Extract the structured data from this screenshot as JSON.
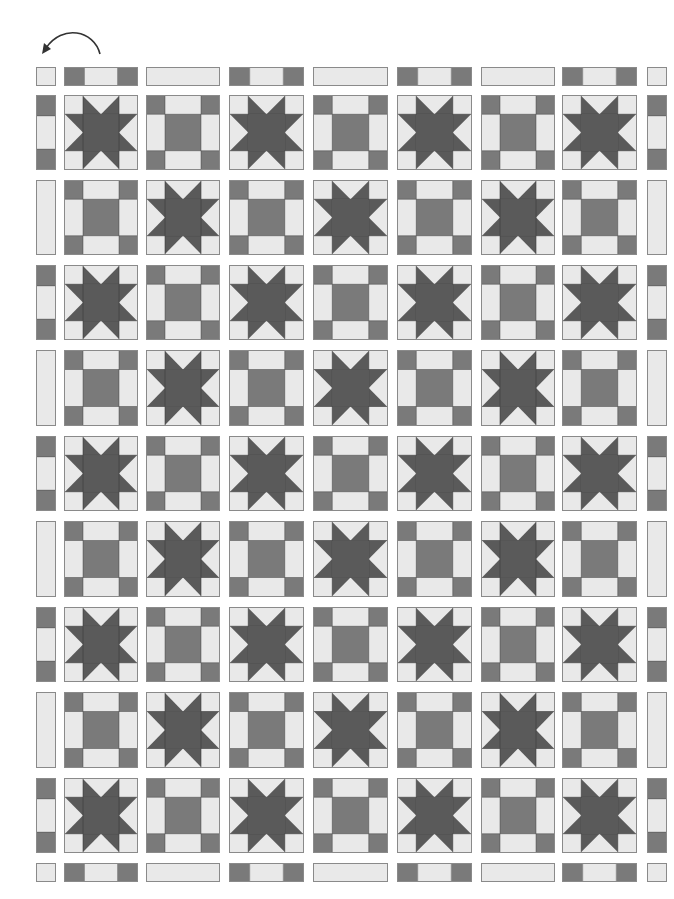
{
  "diagram": {
    "type": "quilt-layout",
    "arrow": {
      "icon": "rotate-counterclockwise-arrow",
      "direction": "counterclockwise"
    },
    "grid": {
      "block_columns": 7,
      "block_rows": 9
    },
    "colors": {
      "light": "#e9e9e9",
      "medium": "#7a7a7a",
      "dark": "#5a5a5a",
      "outline": "#8a8a8a",
      "seam": "#3a3a3a"
    },
    "columns_x": [
      {
        "x": 64,
        "w": 74
      },
      {
        "x": 146,
        "w": 74
      },
      {
        "x": 229,
        "w": 75
      },
      {
        "x": 313,
        "w": 75
      },
      {
        "x": 397,
        "w": 75
      },
      {
        "x": 481,
        "w": 74
      },
      {
        "x": 562,
        "w": 75
      }
    ],
    "side_strip_left": {
      "x": 36,
      "w": 20
    },
    "side_strip_right": {
      "x": 647,
      "w": 20
    },
    "rows_y": [
      {
        "y": 95,
        "h": 75
      },
      {
        "y": 180,
        "h": 75
      },
      {
        "y": 265,
        "h": 75
      },
      {
        "y": 350,
        "h": 76
      },
      {
        "y": 436,
        "h": 75
      },
      {
        "y": 521,
        "h": 76
      },
      {
        "y": 607,
        "h": 75
      },
      {
        "y": 692,
        "h": 76
      },
      {
        "y": 778,
        "h": 75
      }
    ],
    "sash_top": {
      "y": 67,
      "h": 19
    },
    "sash_bottom": {
      "y": 863,
      "h": 19
    },
    "block_pattern": [
      [
        "star",
        "nine-patch",
        "star",
        "nine-patch",
        "star",
        "nine-patch",
        "star"
      ],
      [
        "nine-patch",
        "star",
        "nine-patch",
        "star",
        "nine-patch",
        "star",
        "nine-patch"
      ],
      [
        "star",
        "nine-patch",
        "star",
        "nine-patch",
        "star",
        "nine-patch",
        "star"
      ],
      [
        "nine-patch",
        "star",
        "nine-patch",
        "star",
        "nine-patch",
        "star",
        "nine-patch"
      ],
      [
        "star",
        "nine-patch",
        "star",
        "nine-patch",
        "star",
        "nine-patch",
        "star"
      ],
      [
        "nine-patch",
        "star",
        "nine-patch",
        "star",
        "nine-patch",
        "star",
        "nine-patch"
      ],
      [
        "star",
        "nine-patch",
        "star",
        "nine-patch",
        "star",
        "nine-patch",
        "star"
      ],
      [
        "nine-patch",
        "star",
        "nine-patch",
        "star",
        "nine-patch",
        "star",
        "nine-patch"
      ],
      [
        "star",
        "nine-patch",
        "star",
        "nine-patch",
        "star",
        "nine-patch",
        "star"
      ]
    ],
    "side_strips": [
      "striped",
      "plain",
      "striped",
      "plain",
      "striped",
      "plain",
      "striped",
      "plain",
      "striped"
    ],
    "top_bottom_sashing": [
      "striped",
      "plain",
      "striped",
      "plain",
      "striped",
      "plain",
      "striped"
    ],
    "corner_squares": [
      "top-left",
      "top-right",
      "bottom-left",
      "bottom-right"
    ]
  }
}
